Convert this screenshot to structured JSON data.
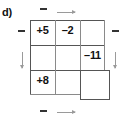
{
  "figure": {
    "part_label": "d)",
    "kind": "magic-square-puzzle-grid"
  },
  "grid": {
    "rows": 3,
    "cols": 3,
    "cells": [
      {
        "row": 0,
        "col": 0,
        "value": "+5",
        "filled": true
      },
      {
        "row": 0,
        "col": 1,
        "value": "–2",
        "filled": true
      },
      {
        "row": 0,
        "col": 2,
        "value": "",
        "filled": false
      },
      {
        "row": 1,
        "col": 0,
        "value": "",
        "filled": false
      },
      {
        "row": 1,
        "col": 1,
        "value": "",
        "filled": false
      },
      {
        "row": 1,
        "col": 2,
        "value": "–11",
        "filled": true
      },
      {
        "row": 2,
        "col": 0,
        "value": "+8",
        "filled": true
      },
      {
        "row": 2,
        "col": 1,
        "value": "",
        "filled": false
      },
      {
        "row": 2,
        "col": 2,
        "value": "",
        "filled": false
      }
    ]
  },
  "annotations": {
    "top_minus": "–",
    "top_arrow": "arrow-right-icon",
    "bottom_minus": "–",
    "bottom_arrow": "arrow-right-icon",
    "left_minus": "–",
    "left_arrow": "arrow-down-icon",
    "right_minus": "–",
    "right_arrow": "arrow-down-icon"
  },
  "colors": {
    "line": "#8a8a8a",
    "line_strong": "#555555",
    "text": "#111111",
    "arrow": "#9a9a9a",
    "background": "#ffffff"
  }
}
